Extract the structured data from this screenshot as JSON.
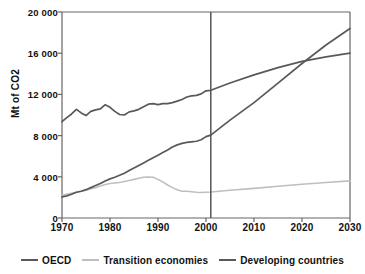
{
  "chart_data": {
    "type": "line",
    "title": "",
    "xlabel": "",
    "ylabel": "Mt of CO2",
    "xlim": [
      1970,
      2030
    ],
    "ylim": [
      0,
      20000
    ],
    "grid": false,
    "legend_position": "bottom",
    "xticks": [
      "1970",
      "1980",
      "1990",
      "2000",
      "2010",
      "2020",
      "2030"
    ],
    "xtick_values": [
      1970,
      1980,
      1990,
      2000,
      2010,
      2020,
      2030
    ],
    "yticks": [
      "0",
      "4 000",
      "8 000",
      "12 000",
      "16 000",
      "20 000"
    ],
    "ytick_values": [
      0,
      4000,
      8000,
      12000,
      16000,
      20000
    ],
    "annotations": [
      {
        "name": "projection-divider",
        "type": "vline",
        "x": 2001,
        "color": "#555555"
      }
    ],
    "x": [
      1970,
      1971,
      1972,
      1973,
      1974,
      1975,
      1976,
      1977,
      1978,
      1979,
      1980,
      1981,
      1982,
      1983,
      1984,
      1985,
      1986,
      1987,
      1988,
      1989,
      1990,
      1991,
      1992,
      1993,
      1994,
      1995,
      1996,
      1997,
      1998,
      1999,
      2000,
      2001,
      2005,
      2010,
      2015,
      2020,
      2025,
      2030
    ],
    "series": [
      {
        "name": "OECD",
        "color": "#595959",
        "values": [
          9350,
          9750,
          10100,
          10550,
          10200,
          9950,
          10350,
          10500,
          10600,
          11000,
          10750,
          10350,
          10050,
          10000,
          10300,
          10400,
          10550,
          10800,
          11050,
          11100,
          11000,
          11100,
          11100,
          11200,
          11350,
          11500,
          11750,
          11850,
          11900,
          12050,
          12350,
          12400,
          13100,
          13900,
          14600,
          15200,
          15650,
          16000
        ]
      },
      {
        "name": "Transition economies",
        "color": "#bfbfbf",
        "values": [
          2200,
          2300,
          2400,
          2500,
          2600,
          2700,
          2850,
          2950,
          3100,
          3250,
          3350,
          3400,
          3450,
          3550,
          3650,
          3750,
          3850,
          3950,
          3980,
          3950,
          3750,
          3500,
          3200,
          2950,
          2750,
          2600,
          2600,
          2550,
          2500,
          2480,
          2500,
          2520,
          2700,
          2880,
          3080,
          3280,
          3450,
          3600
        ],
        "linewidth": 1.6
      },
      {
        "name": "Developing countries",
        "color": "#595959",
        "values": [
          2050,
          2150,
          2300,
          2500,
          2600,
          2750,
          2950,
          3150,
          3350,
          3600,
          3800,
          3950,
          4150,
          4350,
          4600,
          4850,
          5100,
          5350,
          5600,
          5850,
          6100,
          6350,
          6600,
          6900,
          7100,
          7250,
          7350,
          7400,
          7450,
          7600,
          7900,
          8050,
          9500,
          11200,
          13100,
          15000,
          16800,
          18400
        ]
      }
    ]
  },
  "legend": {
    "items": [
      {
        "label": "OECD",
        "color": "#595959"
      },
      {
        "label": "Transition economies",
        "color": "#bfbfbf"
      },
      {
        "label": "Developing countries",
        "color": "#595959"
      }
    ]
  },
  "axes": {
    "frame_color": "#666666"
  }
}
